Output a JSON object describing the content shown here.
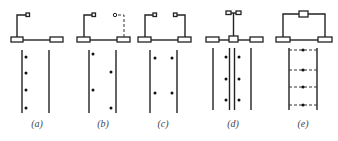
{
  "figure": {
    "panels": [
      {
        "id": "a",
        "label": "(a)"
      },
      {
        "id": "b",
        "label": "(b)"
      },
      {
        "id": "c",
        "label": "(c)"
      },
      {
        "id": "d",
        "label": "(d)"
      },
      {
        "id": "e",
        "label": "(e)"
      }
    ]
  },
  "colors": {
    "line": "#222222",
    "label": "#444444",
    "background": "#ffffff"
  }
}
